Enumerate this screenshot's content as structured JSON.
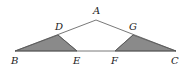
{
  "diagram": {
    "points": {
      "A": {
        "label": "A",
        "x": 96,
        "y": 20
      },
      "B": {
        "label": "B",
        "x": 15,
        "y": 51
      },
      "C": {
        "label": "C",
        "x": 176,
        "y": 51
      },
      "D": {
        "label": "D",
        "x": 58,
        "y": 35
      },
      "E": {
        "label": "E",
        "x": 77,
        "y": 51
      },
      "F": {
        "label": "F",
        "x": 115,
        "y": 51
      },
      "G": {
        "label": "G",
        "x": 133,
        "y": 35
      }
    },
    "shaded_regions": [
      "BDE",
      "GFC"
    ],
    "colors": {
      "line": "#555555",
      "shade": "#8a8a8a"
    }
  }
}
